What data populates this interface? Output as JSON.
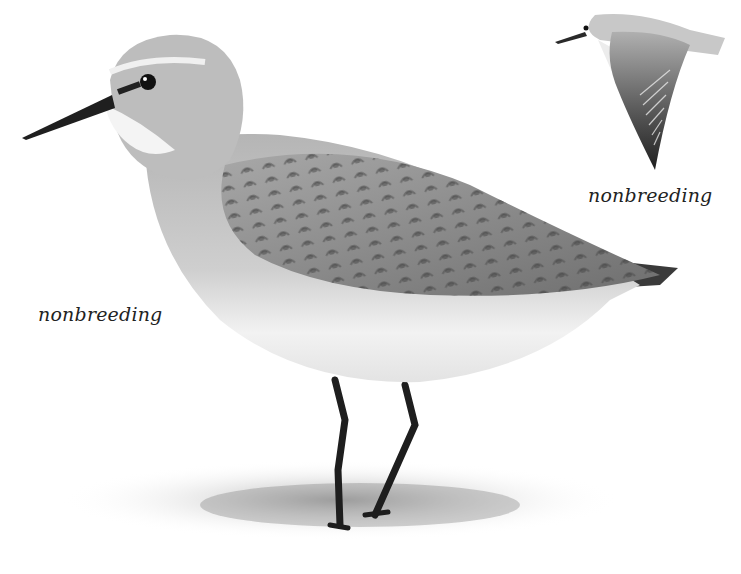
{
  "illustration": {
    "subject": "sandpiper",
    "style": "grayscale pencil illustration",
    "figures": [
      {
        "id": "standing-bird",
        "pose": "standing",
        "caption": "nonbreeding"
      },
      {
        "id": "flying-bird",
        "pose": "flight",
        "caption": "nonbreeding"
      }
    ]
  },
  "labels": {
    "main": "nonbreeding",
    "flight": "nonbreeding"
  },
  "colors": {
    "background": "#ffffff",
    "text": "#222222",
    "plumage_light": "#d9d9d9",
    "plumage_mid": "#9a9a9a",
    "plumage_dark": "#3a3a3a"
  }
}
